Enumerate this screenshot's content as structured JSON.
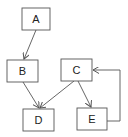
{
  "diagram": {
    "type": "directed-graph",
    "nodes": [
      {
        "id": "A",
        "label": "A",
        "x": 22,
        "y": 8,
        "w": 28,
        "h": 22
      },
      {
        "id": "B",
        "label": "B",
        "x": 7,
        "y": 60,
        "w": 31,
        "h": 22
      },
      {
        "id": "C",
        "label": "C",
        "x": 61,
        "y": 59,
        "w": 31,
        "h": 22
      },
      {
        "id": "D",
        "label": "D",
        "x": 23,
        "y": 109,
        "w": 31,
        "h": 22
      },
      {
        "id": "E",
        "label": "E",
        "x": 77,
        "y": 108,
        "w": 30,
        "h": 22
      }
    ],
    "edges": [
      {
        "from": "A",
        "to": "B"
      },
      {
        "from": "B",
        "to": "D"
      },
      {
        "from": "C",
        "to": "D"
      },
      {
        "from": "C",
        "to": "E"
      },
      {
        "from": "E",
        "to": "C",
        "routing": "orthogonal-right-loop"
      }
    ],
    "colors": {
      "stroke": "#555555",
      "fill": "#ffffff",
      "text": "#222222"
    }
  }
}
